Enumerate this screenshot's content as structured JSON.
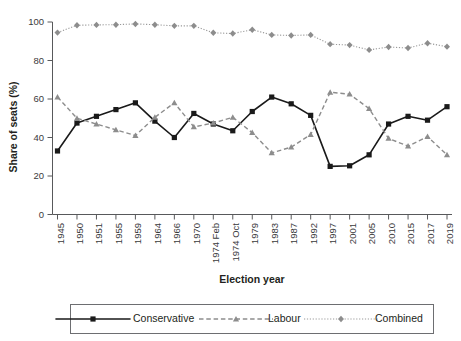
{
  "chart_data": {
    "type": "line",
    "title": "",
    "xlabel": "Election year",
    "ylabel": "Share of seats (%)",
    "ylim": [
      0,
      100
    ],
    "yticks": [
      0,
      20,
      40,
      60,
      80,
      100
    ],
    "ytick_labels": [
      "0",
      "20",
      "40",
      "60",
      "80",
      "100"
    ],
    "grid": false,
    "legend_position": "bottom",
    "categories": [
      "1945",
      "1950",
      "1951",
      "1955",
      "1959",
      "1964",
      "1966",
      "1970",
      "1974 Feb",
      "1974 Oct",
      "1979",
      "1983",
      "1987",
      "1992",
      "1997",
      "2001",
      "2005",
      "2010",
      "2015",
      "2017",
      "2019"
    ],
    "series": [
      {
        "name": "Conservative",
        "color": "#1a1a1a",
        "marker": "square",
        "linestyle": "solid",
        "values": [
          33,
          47.5,
          51,
          54.5,
          58,
          48.5,
          40,
          52.5,
          47,
          43.5,
          53.5,
          61,
          57.5,
          51.5,
          25,
          25.3,
          31,
          47,
          51,
          49,
          56
        ]
      },
      {
        "name": "Labour",
        "color": "#8d8d8d",
        "marker": "triangle",
        "linestyle": "dashed",
        "values": [
          61,
          50,
          47,
          44,
          41,
          50.5,
          58,
          45.5,
          47.5,
          50.5,
          42.5,
          32,
          35,
          41.5,
          63.5,
          62.5,
          55,
          39.5,
          35.5,
          40.5,
          31
        ]
      },
      {
        "name": "Combined",
        "color": "#8d8d8d",
        "marker": "diamond",
        "linestyle": "dotted",
        "values": [
          94.5,
          98.3,
          98.5,
          98.6,
          99,
          98.6,
          98,
          98,
          94.4,
          94,
          96,
          93.3,
          93,
          93.3,
          88.5,
          88,
          85.5,
          87,
          86.5,
          89,
          87.2
        ]
      }
    ]
  },
  "axes": {
    "y_axis_name": "Share of seats (%)",
    "x_axis_name": "Election year"
  },
  "legend": {
    "items": [
      {
        "label": "Conservative",
        "key": "conservative"
      },
      {
        "label": "Labour",
        "key": "labour"
      },
      {
        "label": "Combined",
        "key": "combined"
      }
    ]
  },
  "colors": {
    "conservative": "#1a1a1a",
    "labour": "#8d8d8d",
    "combined": "#9a9a9a",
    "axis": "#58595b",
    "text": "#231f20",
    "background": "#ffffff"
  }
}
